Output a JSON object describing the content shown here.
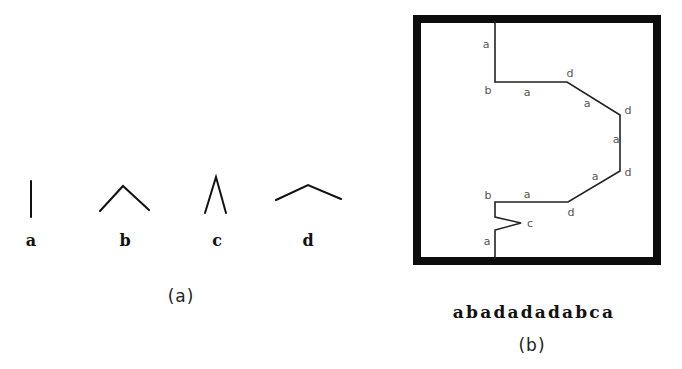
{
  "panel_a": {
    "caption": "(a)",
    "primitives": [
      {
        "label": "a",
        "shape": "vertical-line"
      },
      {
        "label": "b",
        "shape": "wide-caret"
      },
      {
        "label": "c",
        "shape": "narrow-caret"
      },
      {
        "label": "d",
        "shape": "flat-caret"
      }
    ]
  },
  "panel_b": {
    "caption": "(b)",
    "chain_code": "abadadadabca",
    "segment_labels": [
      {
        "text": "a",
        "x": 486,
        "y": 44
      },
      {
        "text": "b",
        "x": 488,
        "y": 90
      },
      {
        "text": "a",
        "x": 527,
        "y": 92
      },
      {
        "text": "d",
        "x": 570,
        "y": 73
      },
      {
        "text": "a",
        "x": 587,
        "y": 103
      },
      {
        "text": "d",
        "x": 628,
        "y": 110
      },
      {
        "text": "a",
        "x": 616,
        "y": 139
      },
      {
        "text": "a",
        "x": 595,
        "y": 176
      },
      {
        "text": "d",
        "x": 628,
        "y": 172
      },
      {
        "text": "b",
        "x": 488,
        "y": 195
      },
      {
        "text": "a",
        "x": 527,
        "y": 194
      },
      {
        "text": "d",
        "x": 571,
        "y": 212
      },
      {
        "text": "c",
        "x": 530,
        "y": 223
      },
      {
        "text": "a",
        "x": 487,
        "y": 241
      }
    ]
  }
}
